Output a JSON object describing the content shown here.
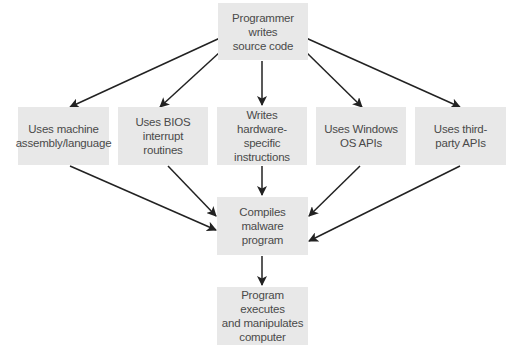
{
  "diagram": {
    "type": "flowchart",
    "nodes": {
      "source": {
        "lines": [
          "Programmer writes",
          "source code"
        ]
      },
      "assembly": {
        "lines": [
          "Uses machine",
          "assembly/language"
        ]
      },
      "bios": {
        "lines": [
          "Uses BIOS interrupt",
          "routines"
        ]
      },
      "hardware": {
        "lines": [
          "Writes hardware-",
          "specific instructions"
        ]
      },
      "windows": {
        "lines": [
          "Uses Windows",
          "OS APIs"
        ]
      },
      "thirdparty": {
        "lines": [
          "Uses third-",
          "party APIs"
        ]
      },
      "compile": {
        "lines": [
          "Compiles malware",
          "program"
        ]
      },
      "execute": {
        "lines": [
          "Program executes",
          "and manipulates",
          "computer"
        ]
      }
    },
    "edges": [
      {
        "from": "source",
        "to": "assembly"
      },
      {
        "from": "source",
        "to": "bios"
      },
      {
        "from": "source",
        "to": "hardware"
      },
      {
        "from": "source",
        "to": "windows"
      },
      {
        "from": "source",
        "to": "thirdparty"
      },
      {
        "from": "assembly",
        "to": "compile"
      },
      {
        "from": "bios",
        "to": "compile"
      },
      {
        "from": "hardware",
        "to": "compile"
      },
      {
        "from": "windows",
        "to": "compile"
      },
      {
        "from": "thirdparty",
        "to": "compile"
      },
      {
        "from": "compile",
        "to": "execute"
      }
    ],
    "colors": {
      "box_fill": "#e8e8e8",
      "text": "#4a4a4a",
      "arrow": "#222222"
    }
  }
}
